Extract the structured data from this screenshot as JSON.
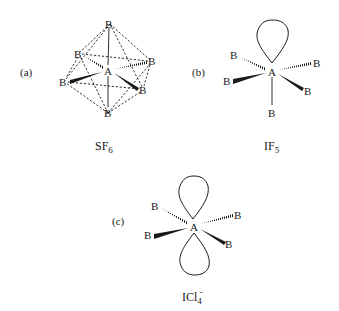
{
  "figure": {
    "panels": [
      {
        "id": "a",
        "label": "(a)",
        "formula_main": "SF",
        "formula_sub": "6",
        "formula_sup": "",
        "central_atom": "A",
        "ligand_label": "B",
        "geometry": "octahedral",
        "lone_pairs": 0
      },
      {
        "id": "b",
        "label": "(b)",
        "formula_main": "IF",
        "formula_sub": "5",
        "formula_sup": "",
        "central_atom": "A",
        "ligand_label": "B",
        "geometry": "square pyramidal",
        "lone_pairs": 1
      },
      {
        "id": "c",
        "label": "(c)",
        "formula_main": "ICl",
        "formula_sub": "4",
        "formula_sup": "-",
        "central_atom": "A",
        "ligand_label": "B",
        "geometry": "square planar",
        "lone_pairs": 2
      }
    ]
  }
}
